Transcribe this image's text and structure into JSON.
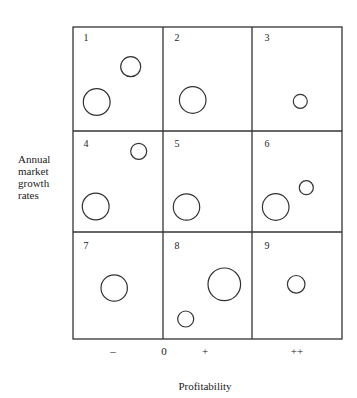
{
  "diagram": {
    "type": "portfolio-matrix",
    "y_axis_label_lines": [
      "Annual",
      "market",
      "growth",
      "rates"
    ],
    "x_axis_title": "Profitability",
    "x_ticks": [
      {
        "label": "–",
        "x": 113
      },
      {
        "label": "0",
        "x": 164
      },
      {
        "label": "+",
        "x": 205
      },
      {
        "label": "++",
        "x": 297
      }
    ],
    "grid": {
      "left": 73,
      "right": 342,
      "top": 27,
      "bottom": 339,
      "col_lines": [
        163,
        252
      ],
      "row_lines": [
        131,
        232
      ],
      "stroke": "#333333"
    },
    "cells": [
      {
        "number": "1",
        "label_pos": [
          86,
          37
        ],
        "circles": [
          {
            "cx": 130.7,
            "cy": 66.7,
            "r": 10
          },
          {
            "cx": 96.7,
            "cy": 102,
            "r": 13.4
          }
        ]
      },
      {
        "number": "2",
        "label_pos": [
          177,
          37
        ],
        "circles": [
          {
            "cx": 192.7,
            "cy": 100,
            "r": 13.3
          }
        ]
      },
      {
        "number": "3",
        "label_pos": [
          267,
          37
        ],
        "circles": [
          {
            "cx": 300.3,
            "cy": 101.3,
            "r": 7
          }
        ]
      },
      {
        "number": "4",
        "label_pos": [
          86,
          143
        ],
        "circles": [
          {
            "cx": 138.7,
            "cy": 151.3,
            "r": 8
          },
          {
            "cx": 95.7,
            "cy": 206.5,
            "r": 13.4
          }
        ]
      },
      {
        "number": "5",
        "label_pos": [
          177,
          143
        ],
        "circles": [
          {
            "cx": 186.5,
            "cy": 207,
            "r": 13.2
          }
        ]
      },
      {
        "number": "6",
        "label_pos": [
          267,
          143
        ],
        "circles": [
          {
            "cx": 306.3,
            "cy": 187.7,
            "r": 7
          },
          {
            "cx": 275.7,
            "cy": 207,
            "r": 13.3
          }
        ]
      },
      {
        "number": "7",
        "label_pos": [
          86,
          245
        ],
        "circles": [
          {
            "cx": 114.2,
            "cy": 288,
            "r": 13.2
          }
        ]
      },
      {
        "number": "8",
        "label_pos": [
          177,
          245
        ],
        "circles": [
          {
            "cx": 224.3,
            "cy": 284.3,
            "r": 16.3
          },
          {
            "cx": 185.7,
            "cy": 319,
            "r": 8
          }
        ]
      },
      {
        "number": "9",
        "label_pos": [
          267,
          245
        ],
        "circles": [
          {
            "cx": 296.2,
            "cy": 284.3,
            "r": 8.8
          }
        ]
      }
    ]
  }
}
